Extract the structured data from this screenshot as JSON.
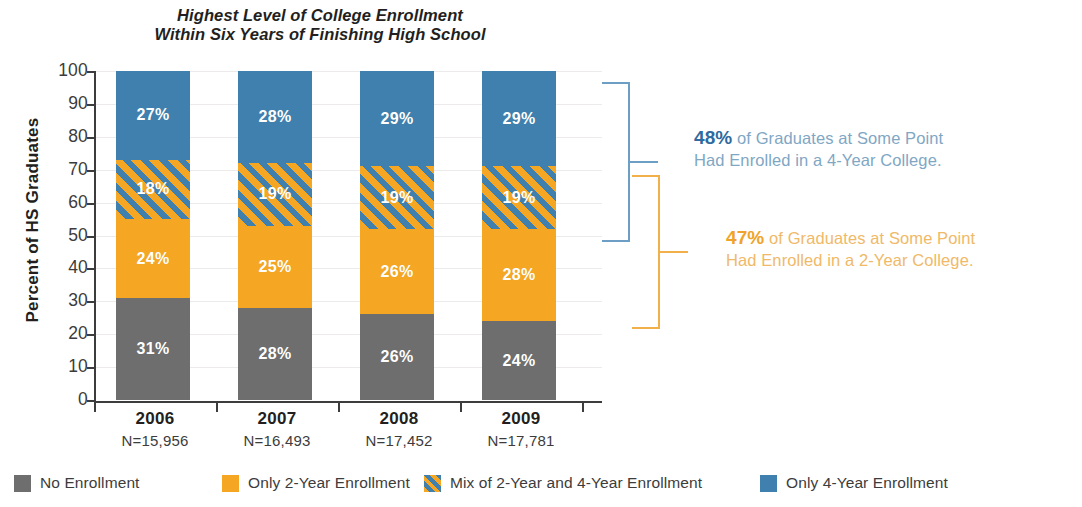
{
  "title": {
    "line1": "Highest Level of College Enrollment",
    "line2": "Within Six Years of Finishing High School"
  },
  "axes": {
    "y_title": "Percent of HS Graduates",
    "y_ticks": [
      "100",
      "90",
      "80",
      "70",
      "60",
      "50",
      "40",
      "30",
      "20",
      "10",
      "0"
    ]
  },
  "colors": {
    "no_enrollment": "#6e6e6e",
    "only_2year": "#f5a623",
    "mix_2and4": "#f5a623",
    "only_4year": "#3f80ae",
    "bracket_blue": "#6d9ec4",
    "bracket_orange": "#f2b04a",
    "callout_blue_text": "#7fa7c4",
    "callout_blue_pct": "#2e6b9e",
    "callout_orange_text": "#f0b968",
    "callout_orange_pct": "#f0a32a"
  },
  "categories": [
    {
      "year": "2006",
      "n": "N=15,956"
    },
    {
      "year": "2007",
      "n": "N=16,493"
    },
    {
      "year": "2008",
      "n": "N=17,452"
    },
    {
      "year": "2009",
      "n": "N=17,781"
    }
  ],
  "bars": [
    {
      "year": "2006",
      "segments": [
        {
          "key": "only_4year",
          "label": "27%",
          "value": 27
        },
        {
          "key": "mix_2and4",
          "label": "18%",
          "value": 18
        },
        {
          "key": "only_2year",
          "label": "24%",
          "value": 24
        },
        {
          "key": "no_enrollment",
          "label": "31%",
          "value": 31
        }
      ]
    },
    {
      "year": "2007",
      "segments": [
        {
          "key": "only_4year",
          "label": "28%",
          "value": 28
        },
        {
          "key": "mix_2and4",
          "label": "19%",
          "value": 19
        },
        {
          "key": "only_2year",
          "label": "25%",
          "value": 25
        },
        {
          "key": "no_enrollment",
          "label": "28%",
          "value": 28
        }
      ]
    },
    {
      "year": "2008",
      "segments": [
        {
          "key": "only_4year",
          "label": "29%",
          "value": 29
        },
        {
          "key": "mix_2and4",
          "label": "19%",
          "value": 19
        },
        {
          "key": "only_2year",
          "label": "26%",
          "value": 26
        },
        {
          "key": "no_enrollment",
          "label": "26%",
          "value": 26
        }
      ]
    },
    {
      "year": "2009",
      "segments": [
        {
          "key": "only_4year",
          "label": "29%",
          "value": 29
        },
        {
          "key": "mix_2and4",
          "label": "19%",
          "value": 19
        },
        {
          "key": "only_2year",
          "label": "28%",
          "value": 28
        },
        {
          "key": "no_enrollment",
          "label": "24%",
          "value": 24
        }
      ]
    }
  ],
  "callouts": {
    "four_year": {
      "pct": "48%",
      "line1_rest": " of Graduates at Some Point",
      "line2": "Had Enrolled in a 4-Year College."
    },
    "two_year": {
      "pct": "47%",
      "line1_rest": " of Graduates at Some Point",
      "line2": "Had Enrolled in a 2-Year College."
    }
  },
  "legend": [
    {
      "key": "no_enrollment",
      "label": "No Enrollment"
    },
    {
      "key": "only_2year",
      "label": "Only 2-Year Enrollment"
    },
    {
      "key": "mix_2and4",
      "label": "Mix of 2-Year and 4-Year Enrollment"
    },
    {
      "key": "only_4year",
      "label": "Only 4-Year Enrollment"
    }
  ],
  "chart_data": {
    "type": "bar",
    "subtype": "stacked-100-percent",
    "title": "Highest Level of College Enrollment Within Six Years of Finishing High School",
    "xlabel": "",
    "ylabel": "Percent of HS Graduates",
    "ylim": [
      0,
      100
    ],
    "ytick_step": 10,
    "grid": true,
    "legend_position": "bottom",
    "categories": [
      "2006",
      "2007",
      "2008",
      "2009"
    ],
    "category_sublabels": [
      "N=15,956",
      "N=16,493",
      "N=17,452",
      "N=17,781"
    ],
    "series": [
      {
        "name": "No Enrollment",
        "values": [
          31,
          28,
          26,
          24
        ],
        "color": "#6e6e6e"
      },
      {
        "name": "Only 2-Year Enrollment",
        "values": [
          24,
          25,
          26,
          28
        ],
        "color": "#f5a623"
      },
      {
        "name": "Mix of 2-Year and 4-Year Enrollment",
        "values": [
          18,
          19,
          19,
          19
        ],
        "color": "#f5a623",
        "pattern": "diagonal-stripes-orange-blue"
      },
      {
        "name": "Only 4-Year Enrollment",
        "values": [
          27,
          28,
          29,
          29
        ],
        "color": "#3f80ae"
      }
    ],
    "annotations": [
      {
        "text": "48% of Graduates at Some Point Had Enrolled in a 4-Year College.",
        "value": 48,
        "color": "#2e6b9e",
        "covers_series": [
          "Mix of 2-Year and 4-Year Enrollment",
          "Only 4-Year Enrollment"
        ]
      },
      {
        "text": "47% of Graduates at Some Point Had Enrolled in a 2-Year College.",
        "value": 47,
        "color": "#f0a32a",
        "covers_series": [
          "Only 2-Year Enrollment",
          "Mix of 2-Year and 4-Year Enrollment"
        ]
      }
    ]
  }
}
